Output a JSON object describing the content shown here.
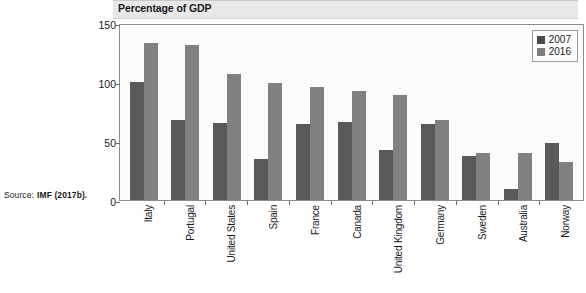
{
  "source_note": {
    "label": "Source:",
    "value": "IMF (2017b)."
  },
  "chart_data": {
    "type": "bar",
    "title": "Percentage of GDP",
    "xlabel": "",
    "ylabel": "",
    "ylim": [
      0,
      150
    ],
    "yticks": [
      0,
      50,
      100,
      150
    ],
    "grid": false,
    "legend_position": "top-right",
    "colors": {
      "series_2007": "#595959",
      "series_2016": "#808080",
      "plot_background": "#fbfbfb",
      "title_banner": "#e8e8e8",
      "axis": "#8c8c8c"
    },
    "categories": [
      "Italy",
      "Portugal",
      "United States",
      "Spain",
      "France",
      "Canada",
      "United Kingdom",
      "Germany",
      "Sweden",
      "Australia",
      "Norway"
    ],
    "series": [
      {
        "name": "2007",
        "values": [
          100,
          68,
          65,
          35,
          64,
          66,
          42,
          64,
          37,
          9,
          48
        ]
      },
      {
        "name": "2016",
        "values": [
          133,
          131,
          107,
          99,
          96,
          92,
          89,
          68,
          40,
          40,
          32
        ]
      }
    ]
  }
}
